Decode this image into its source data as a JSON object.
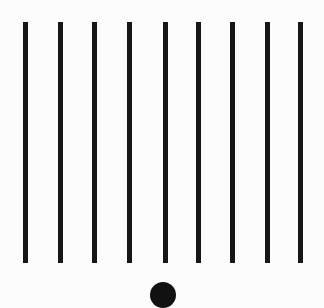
{
  "scene": {
    "background": "#fcfcfc",
    "bar_color": "#161616",
    "circle_color": "#111111",
    "bars": [
      {
        "x": 23,
        "width": 5
      },
      {
        "x": 58,
        "width": 5
      },
      {
        "x": 92,
        "width": 5
      },
      {
        "x": 127,
        "width": 5
      },
      {
        "x": 163,
        "width": 5
      },
      {
        "x": 196,
        "width": 5
      },
      {
        "x": 230,
        "width": 5
      },
      {
        "x": 265,
        "width": 5
      },
      {
        "x": 298,
        "width": 5
      }
    ],
    "bar_top": 22,
    "bar_bottom": 263,
    "circle": {
      "cx": 163,
      "top": 282,
      "diameter": 26
    }
  }
}
